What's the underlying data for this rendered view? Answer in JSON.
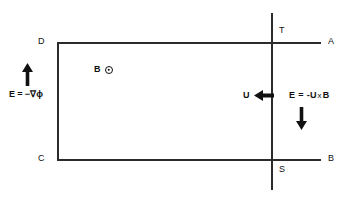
{
  "diagram": {
    "stroke_color": "#2b2b2b",
    "text_color": "#111111",
    "corner_labels": {
      "top_left": "D",
      "top_right": "A",
      "bottom_left": "C",
      "bottom_right": "B",
      "top_vertical": "T",
      "bottom_vertical": "S"
    },
    "annotations": {
      "field_b_label": "B",
      "field_b_symbol": "circle-dot-out-of-page",
      "velocity_label": "U",
      "electrostatic_field": {
        "lhs": "E",
        "equals": "=",
        "rhs": "−∇ϕ"
      },
      "motional_field": {
        "lhs": "E",
        "equals": "=",
        "minus": "-",
        "u": "U",
        "cross": "x",
        "b": "B"
      }
    },
    "arrows": {
      "left_field_arrow": "arrow-up",
      "velocity_arrow": "arrow-left",
      "motional_field_arrow": "arrow-down"
    }
  }
}
